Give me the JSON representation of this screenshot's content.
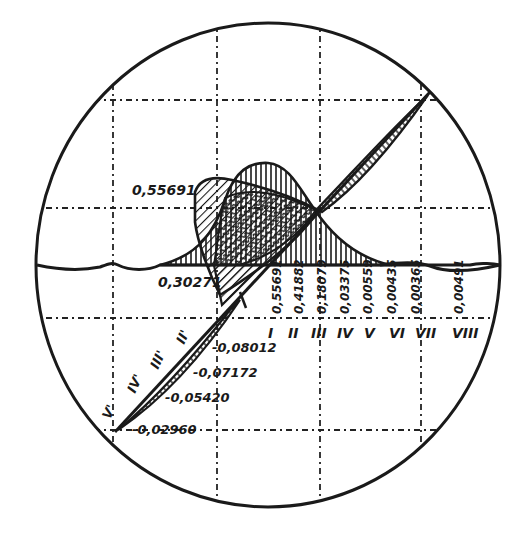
{
  "figure": {
    "type": "circular-diagram",
    "colors": {
      "ink": "#1a1a1a",
      "background": "#ffffff"
    }
  },
  "labels": {
    "peak_value": "0,55691",
    "left_base_value": "0,30271",
    "horizontal_categories": [
      {
        "numeral": "I",
        "value": "0,55691"
      },
      {
        "numeral": "II",
        "value": "0,41882"
      },
      {
        "numeral": "III",
        "value": "0,18079"
      },
      {
        "numeral": "IV",
        "value": "0,03375"
      },
      {
        "numeral": "V",
        "value": "0,00559"
      },
      {
        "numeral": "VI",
        "value": "0,00435"
      },
      {
        "numeral": "VII",
        "value": "0,00365"
      },
      {
        "numeral": "VIII",
        "value": "0,00491"
      }
    ],
    "diagonal_categories": [
      {
        "numeral": "II'",
        "value": "-0,08012"
      },
      {
        "numeral": "III'",
        "value": "-0,07172"
      },
      {
        "numeral": "IV'",
        "value": "-0,05420"
      },
      {
        "numeral": "V'",
        "value": "-0,02960"
      }
    ],
    "small_mark": "a"
  }
}
